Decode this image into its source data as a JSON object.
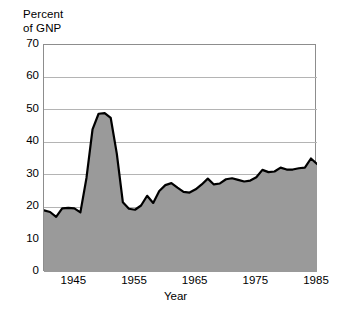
{
  "chart_data": {
    "type": "area",
    "title": "",
    "subtitle": "",
    "xlabel": "Year",
    "ylabel": "Percent of GNP",
    "ylabel_lines": [
      "Percent",
      "of GNP"
    ],
    "xlim": [
      1940,
      1985
    ],
    "ylim": [
      0,
      70
    ],
    "yticks": [
      0,
      10,
      20,
      30,
      40,
      50,
      60,
      70
    ],
    "ytick_labels": [
      "0",
      "10",
      "20",
      "30",
      "40",
      "50",
      "60",
      "70"
    ],
    "xticks": [
      1945,
      1955,
      1965,
      1975,
      1985
    ],
    "xtick_labels": [
      "1945",
      "1955",
      "1965",
      "1975",
      "1985"
    ],
    "grid": "horizontal",
    "legend": "none",
    "colors": {
      "fill": "#9a9a9a",
      "line": "#000000",
      "grid": "#b4b4b4",
      "axis": "#8d8d8d",
      "background": "#ffffff",
      "text": "#000000"
    },
    "x": [
      1940,
      1941,
      1942,
      1943,
      1944,
      1945,
      1946,
      1947,
      1948,
      1949,
      1950,
      1951,
      1952,
      1953,
      1954,
      1955,
      1956,
      1957,
      1958,
      1959,
      1960,
      1961,
      1962,
      1963,
      1964,
      1965,
      1966,
      1967,
      1968,
      1969,
      1970,
      1971,
      1972,
      1973,
      1974,
      1975,
      1976,
      1977,
      1978,
      1979,
      1980,
      1981,
      1982,
      1983,
      1984,
      1985
    ],
    "values": [
      19.0,
      18.5,
      17.0,
      19.6,
      19.8,
      19.6,
      18.4,
      29.0,
      44.0,
      48.8,
      49.0,
      47.5,
      36.5,
      21.5,
      19.5,
      19.2,
      20.5,
      23.5,
      21.3,
      25.0,
      26.8,
      27.4,
      26.0,
      24.7,
      24.5,
      25.5,
      27.0,
      28.8,
      27.0,
      27.3,
      28.6,
      28.9,
      28.4,
      27.9,
      28.2,
      29.2,
      31.5,
      30.8,
      31.0,
      32.2,
      31.6,
      31.6,
      32.0,
      32.2,
      35.0,
      33.3
    ],
    "series": [
      {
        "name": "Percent of GNP",
        "values": [
          19.0,
          18.5,
          17.0,
          19.6,
          19.8,
          19.6,
          18.4,
          29.0,
          44.0,
          48.8,
          49.0,
          47.5,
          36.5,
          21.5,
          19.5,
          19.2,
          20.5,
          23.5,
          21.3,
          25.0,
          26.8,
          27.4,
          26.0,
          24.7,
          24.5,
          25.5,
          27.0,
          28.8,
          27.0,
          27.3,
          28.6,
          28.9,
          28.4,
          27.9,
          28.2,
          29.2,
          31.5,
          30.8,
          31.0,
          32.2,
          31.6,
          31.6,
          32.0,
          32.2,
          35.0,
          33.3
        ]
      }
    ],
    "peak_value": 49.0,
    "min_value": 17.0,
    "last_value": 35.8
  }
}
